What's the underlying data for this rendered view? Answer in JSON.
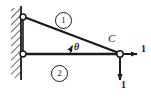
{
  "figure": {
    "width": 151,
    "height": 100,
    "background_color": "#ffffff",
    "line_color": "#1a1a1a"
  },
  "wall": {
    "name": "fixed-support-wall",
    "hatching": "diagonal",
    "face_x": 21,
    "top_y": 8,
    "bottom_y": 78
  },
  "joints": [
    {
      "name": "upper-pin-joint",
      "x": 22,
      "y": 17,
      "label": ""
    },
    {
      "name": "lower-pin-joint",
      "x": 22,
      "y": 54,
      "label": ""
    },
    {
      "name": "joint-c",
      "x": 120,
      "y": 54,
      "label": "C"
    }
  ],
  "members": [
    {
      "name": "member-1",
      "label": "1",
      "from": "upper-pin-joint",
      "to": "joint-c",
      "orientation": "diagonal"
    },
    {
      "name": "member-2",
      "label": "2",
      "from": "lower-pin-joint",
      "to": "joint-c",
      "orientation": "horizontal"
    }
  ],
  "angle": {
    "name": "angle-theta",
    "symbol": "θ",
    "between": [
      "member-2",
      "member-1"
    ],
    "vertex": "joint-c"
  },
  "forces": [
    {
      "name": "horizontal-force",
      "label": "1",
      "direction": "right",
      "applied_at": "joint-c",
      "tip_x": 138,
      "tip_y": 54
    },
    {
      "name": "vertical-force",
      "label": "1",
      "direction": "down",
      "applied_at": "joint-c",
      "tip_x": 120,
      "tip_y": 82
    }
  ],
  "labels": {
    "point_c": "C",
    "theta": "θ",
    "member_one": "1",
    "member_two": "2",
    "force_x": "1",
    "force_y": "1"
  }
}
